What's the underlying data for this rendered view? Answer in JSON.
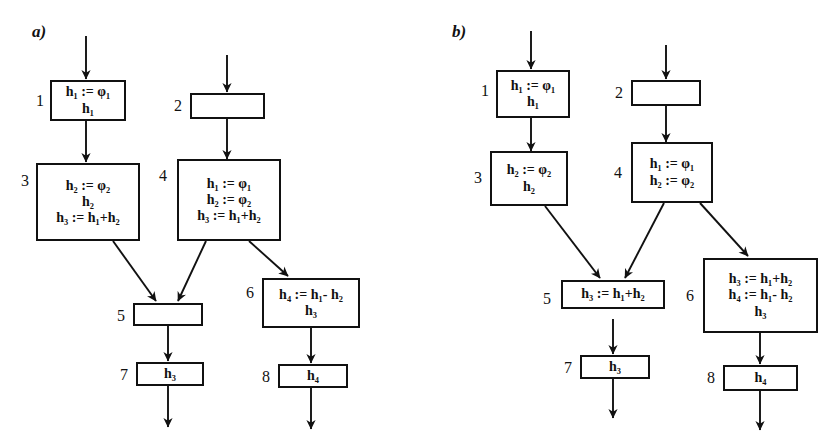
{
  "figure": {
    "panels": [
      {
        "id": "a",
        "label": "a)",
        "nodes": [
          {
            "index": "1",
            "lines": [
              "h₁ := φ₁",
              "h₁"
            ]
          },
          {
            "index": "2",
            "lines": []
          },
          {
            "index": "3",
            "lines": [
              "h₂ := φ₂",
              "h₂",
              "h₃ := h₁+h₂"
            ]
          },
          {
            "index": "4",
            "lines": [
              "h₁ := φ₁",
              "h₂ := φ₂",
              "h₃ := h₁+h₂"
            ]
          },
          {
            "index": "5",
            "lines": []
          },
          {
            "index": "6",
            "lines": [
              "h₄ := h₁- h₂",
              "h₃"
            ]
          },
          {
            "index": "7",
            "lines": [
              "h₃"
            ]
          },
          {
            "index": "8",
            "lines": [
              "h₄"
            ]
          }
        ],
        "edges": [
          {
            "from": "entry",
            "to": "1"
          },
          {
            "from": "entry",
            "to": "2"
          },
          {
            "from": "1",
            "to": "3"
          },
          {
            "from": "2",
            "to": "4"
          },
          {
            "from": "3",
            "to": "5"
          },
          {
            "from": "4",
            "to": "5"
          },
          {
            "from": "4",
            "to": "6"
          },
          {
            "from": "5",
            "to": "7"
          },
          {
            "from": "6",
            "to": "8"
          },
          {
            "from": "7",
            "to": "exit"
          },
          {
            "from": "8",
            "to": "exit"
          }
        ]
      },
      {
        "id": "b",
        "label": "b)",
        "nodes": [
          {
            "index": "1",
            "lines": [
              "h₁ := φ₁",
              "h₁"
            ]
          },
          {
            "index": "2",
            "lines": []
          },
          {
            "index": "3",
            "lines": [
              "h₂ := φ₂",
              "h₂"
            ]
          },
          {
            "index": "4",
            "lines": [
              "h₁ := φ₁",
              "h₂ := φ₂"
            ]
          },
          {
            "index": "5",
            "lines": [
              "h₃ := h₁+h₂"
            ]
          },
          {
            "index": "6",
            "lines": [
              "h₃ := h₁+h₂",
              "h₄ := h₁- h₂",
              "h₃"
            ]
          },
          {
            "index": "7",
            "lines": [
              "h₃"
            ]
          },
          {
            "index": "8",
            "lines": [
              "h₄"
            ]
          }
        ],
        "edges": [
          {
            "from": "entry",
            "to": "1"
          },
          {
            "from": "entry",
            "to": "2"
          },
          {
            "from": "1",
            "to": "3"
          },
          {
            "from": "2",
            "to": "4"
          },
          {
            "from": "3",
            "to": "5"
          },
          {
            "from": "4",
            "to": "5"
          },
          {
            "from": "4",
            "to": "6"
          },
          {
            "from": "5",
            "to": "7"
          },
          {
            "from": "6",
            "to": "8"
          },
          {
            "from": "7",
            "to": "exit"
          },
          {
            "from": "8",
            "to": "exit"
          }
        ]
      }
    ],
    "colors": {
      "stroke": "#111111",
      "background": "#ffffff",
      "text": "#111111"
    }
  }
}
